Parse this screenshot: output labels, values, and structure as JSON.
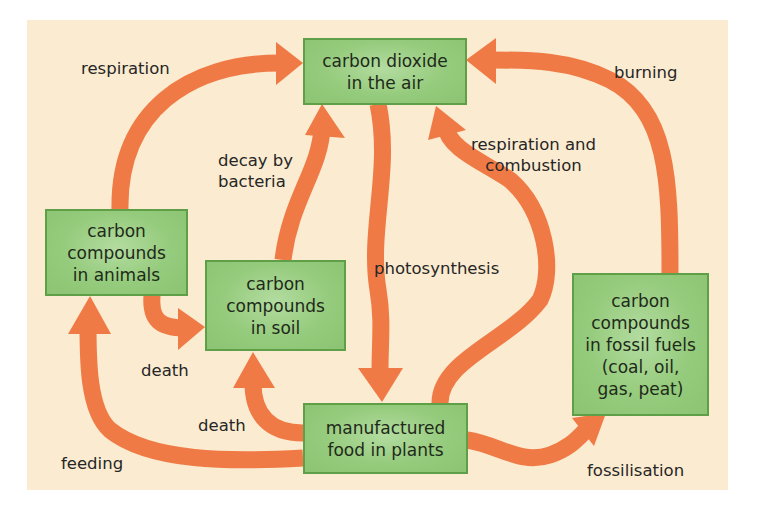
{
  "colors": {
    "background_panel": "#fbebd0",
    "arrow": "#f07a45",
    "box_fill": "#95cb7c",
    "box_border": "#5e9f48",
    "text": "#262626"
  },
  "nodes": {
    "co2_air": "carbon dioxide\nin the air",
    "animals": "carbon\ncompounds\nin animals",
    "soil": "carbon\ncompounds\nin soil",
    "plants": "manufactured\nfood in plants",
    "fossil_fuels": "carbon\ncompounds\nin fossil fuels\n(coal, oil,\ngas, peat)"
  },
  "edges": [
    {
      "from": "animals",
      "to": "co2_air",
      "label": "respiration"
    },
    {
      "from": "soil",
      "to": "co2_air",
      "label": "decay by\nbacteria"
    },
    {
      "from": "co2_air",
      "to": "plants",
      "label": "photosynthesis"
    },
    {
      "from": "plants",
      "to": "co2_air",
      "label": "respiration and\ncombustion"
    },
    {
      "from": "fossil_fuels",
      "to": "co2_air",
      "label": "burning"
    },
    {
      "from": "animals",
      "to": "soil",
      "label": "death"
    },
    {
      "from": "plants",
      "to": "soil",
      "label": "death"
    },
    {
      "from": "plants",
      "to": "animals",
      "label": "feeding"
    },
    {
      "from": "plants",
      "to": "fossil_fuels",
      "label": "fossilisation"
    }
  ],
  "labels": {
    "respiration": "respiration",
    "decay": "decay by\nbacteria",
    "photosynthesis": "photosynthesis",
    "respiration_combustion": "respiration and\ncombustion",
    "burning": "burning",
    "death_animals": "death",
    "death_plants": "death",
    "feeding": "feeding",
    "fossilisation": "fossilisation"
  }
}
